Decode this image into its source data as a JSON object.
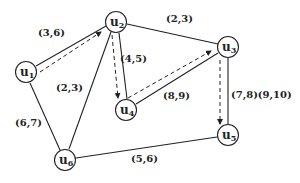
{
  "diagram": {
    "type": "graph",
    "colors": {
      "stroke": "#222222",
      "background": "#ffffff"
    },
    "nodes": [
      {
        "id": "u1",
        "base": "u",
        "sub": "1",
        "x": 26,
        "y": 72
      },
      {
        "id": "u2",
        "base": "u",
        "sub": "2",
        "x": 116,
        "y": 22
      },
      {
        "id": "u3",
        "base": "u",
        "sub": "3",
        "x": 228,
        "y": 47
      },
      {
        "id": "u4",
        "base": "u",
        "sub": "4",
        "x": 126,
        "y": 110
      },
      {
        "id": "u5",
        "base": "u",
        "sub": "5",
        "x": 228,
        "y": 135
      },
      {
        "id": "u6",
        "base": "u",
        "sub": "6",
        "x": 65,
        "y": 160
      }
    ],
    "edges": [
      {
        "from": "u1",
        "to": "u2",
        "label": "(3,6)"
      },
      {
        "from": "u2",
        "to": "u3",
        "label": "(2,3)"
      },
      {
        "from": "u2",
        "to": "u4",
        "label": "(4,5)"
      },
      {
        "from": "u4",
        "to": "u3",
        "label": "(8,9)"
      },
      {
        "from": "u3",
        "to": "u5",
        "label": "(7,8)(9,10)"
      },
      {
        "from": "u1",
        "to": "u6",
        "label": "(6,7)"
      },
      {
        "from": "u2",
        "to": "u6",
        "label": "(2,3)"
      },
      {
        "from": "u6",
        "to": "u5",
        "label": "(5,6)"
      }
    ],
    "path_arrows": [
      {
        "from": "u1",
        "to": "u2",
        "style": "dashed"
      },
      {
        "from": "u2",
        "to": "u4",
        "style": "dashed"
      },
      {
        "from": "u4",
        "to": "u3",
        "style": "dashed"
      },
      {
        "from": "u3",
        "to": "u5",
        "style": "dashed"
      }
    ]
  }
}
